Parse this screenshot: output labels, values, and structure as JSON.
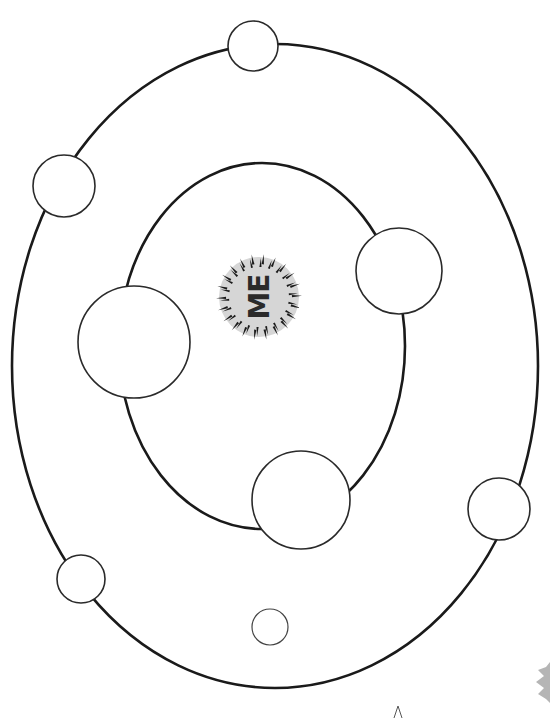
{
  "diagram": {
    "type": "circles-of-relationships worksheet",
    "center_label": "ME",
    "center_label_orientation": "rotated-90-ccw",
    "colors": {
      "background": "#ffffff",
      "line": "#1a1a1a",
      "center_badge": "#d6d6d6",
      "corner_star": "#b5b5b5"
    },
    "orbits": [
      {
        "name": "outer-orbit",
        "cx": 275,
        "cy": 366,
        "rx": 263,
        "ry": 322
      },
      {
        "name": "inner-orbit",
        "cx": 262,
        "cy": 346,
        "rx": 143,
        "ry": 183
      }
    ],
    "inner_slots": [
      {
        "name": "inner-slot-left",
        "cx": 134,
        "cy": 342,
        "r": 56
      },
      {
        "name": "inner-slot-right",
        "cx": 399,
        "cy": 271,
        "r": 43
      },
      {
        "name": "inner-slot-bottom",
        "cx": 301,
        "cy": 500,
        "r": 49
      }
    ],
    "outer_slots": [
      {
        "name": "outer-slot-top",
        "cx": 253,
        "cy": 46,
        "r": 25
      },
      {
        "name": "outer-slot-upper-left",
        "cx": 64,
        "cy": 186,
        "r": 31
      },
      {
        "name": "outer-slot-right",
        "cx": 499,
        "cy": 509,
        "r": 31
      },
      {
        "name": "outer-slot-lower-left",
        "cx": 81,
        "cy": 579,
        "r": 24
      }
    ],
    "free_slots": [
      {
        "name": "free-slot-bottom",
        "cx": 270,
        "cy": 627,
        "r": 18
      }
    ]
  }
}
